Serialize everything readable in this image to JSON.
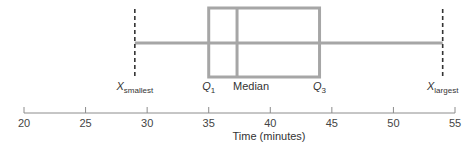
{
  "chart_data": {
    "type": "box",
    "title": "",
    "xlabel": "Time (minutes)",
    "ylabel": "",
    "xlim": [
      20,
      55
    ],
    "ticks": [
      20,
      25,
      30,
      35,
      40,
      45,
      50,
      55
    ],
    "grid": false,
    "values_source": "Numeric values are estimated from pixel positions against the axis ticks; the figure labels these points only symbolically.",
    "summary": {
      "x_smallest": 29,
      "q1": 35,
      "median": 37.3,
      "q3": 44,
      "x_largest": 54
    },
    "labels": {
      "x_smallest": {
        "main": "X",
        "sub": "smallest"
      },
      "q1": {
        "main": "Q",
        "sub": "1"
      },
      "median": "Median",
      "q3": {
        "main": "Q",
        "sub": "3"
      },
      "x_largest": {
        "main": "X",
        "sub": "largest"
      }
    }
  },
  "colors": {
    "box": "#a6a6a6",
    "whisker": "#a6a6a6",
    "extreme_marker": "#333333",
    "axis": "#8c8c8c",
    "text": "#333333"
  },
  "axis": {
    "tick_labels": [
      "20",
      "25",
      "30",
      "35",
      "40",
      "45",
      "50",
      "55"
    ],
    "title": "Time (minutes)"
  }
}
